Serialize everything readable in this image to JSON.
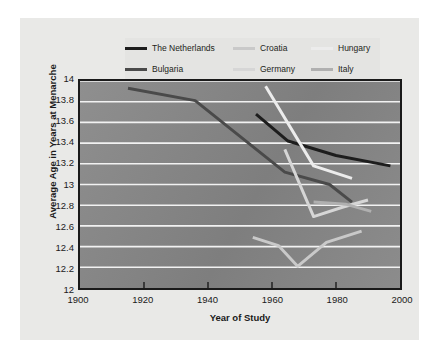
{
  "chart_data": {
    "type": "line",
    "title": "",
    "xlabel": "Year of Study",
    "ylabel": "Average Age in Years at Menarche",
    "xlim": [
      1900,
      2000
    ],
    "ylim": [
      12,
      14
    ],
    "xticks": [
      1900,
      1920,
      1940,
      1960,
      1980,
      2000
    ],
    "yticks": [
      12,
      12.2,
      12.4,
      12.6,
      12.8,
      13,
      13.2,
      13.4,
      13.6,
      13.8,
      14
    ],
    "xtick_labels": [
      "1900",
      "1920",
      "1940",
      "1960",
      "1980",
      "2000"
    ],
    "ytick_labels": [
      "12",
      "12.2",
      "12.4",
      "12.6",
      "12.8",
      "13",
      "13.2",
      "13.4",
      "13.6",
      "13.8",
      "14"
    ],
    "grid": "horizontal",
    "grid_color": "#f2f2f2",
    "plot_bg": "#848484",
    "legend_position": "above-plot",
    "legend_columns": 3,
    "series": [
      {
        "name": "The Netherlands",
        "color": "#1d1d1d",
        "x": [
          1955,
          1965,
          1980,
          1997
        ],
        "y": [
          13.68,
          13.42,
          13.28,
          13.18
        ]
      },
      {
        "name": "Bulgaria",
        "color": "#4a4a4a",
        "x": [
          1915,
          1936,
          1964,
          1978,
          1985
        ],
        "y": [
          13.93,
          13.81,
          13.12,
          13.0,
          12.83
        ]
      },
      {
        "name": "Croatia",
        "color": "#c9c9c9",
        "x": [
          1954,
          1962,
          1968,
          1977,
          1988
        ],
        "y": [
          12.49,
          12.41,
          12.21,
          12.44,
          12.55
        ]
      },
      {
        "name": "Germany",
        "color": "#d6d6d6",
        "x": [
          1964,
          1973,
          1982,
          1990
        ],
        "y": [
          13.34,
          12.69,
          12.78,
          12.85
        ]
      },
      {
        "name": "Hungary",
        "color": "#ececec",
        "x": [
          1958,
          1973,
          1985
        ],
        "y": [
          13.95,
          13.18,
          13.06
        ]
      },
      {
        "name": "Italy",
        "color": "#b0b0b0",
        "x": [
          1973,
          1983,
          1991
        ],
        "y": [
          12.83,
          12.81,
          12.74
        ]
      }
    ]
  },
  "legend": {
    "items": [
      {
        "label": "The Netherlands",
        "color": "#1d1d1d"
      },
      {
        "label": "Croatia",
        "color": "#c9c9c9"
      },
      {
        "label": "Hungary",
        "color": "#ececec"
      },
      {
        "label": "Bulgaria",
        "color": "#4a4a4a"
      },
      {
        "label": "Germany",
        "color": "#d6d6d6"
      },
      {
        "label": "Italy",
        "color": "#b0b0b0"
      }
    ]
  },
  "colors": {
    "page_background": "#ffffff",
    "figure_background": "#e9e9e7",
    "legend_background": "#e4e4e2",
    "axis_border": "#1a1a1a",
    "text": "#1a1a1a"
  }
}
